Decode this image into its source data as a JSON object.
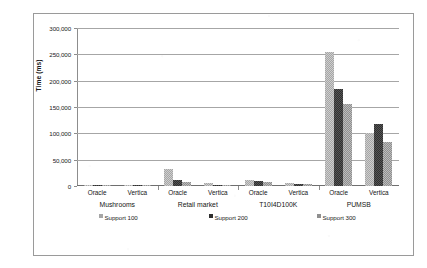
{
  "chart_data": {
    "type": "bar",
    "title": "",
    "xlabel": "",
    "ylabel": "Time (ms)",
    "ylim": [
      0,
      300000
    ],
    "ytick_labels": [
      "300,000",
      "250,000",
      "200,000",
      "150,000",
      "100,000",
      "50,000",
      "0"
    ],
    "ytick_values": [
      300000,
      250000,
      200000,
      150000,
      100000,
      50000,
      0
    ],
    "grid": true,
    "legend_position": "bottom",
    "legend": [
      "Support 100",
      "Support 200",
      "Support 300"
    ],
    "group_labels": [
      "Mushrooms",
      "Retail market",
      "T10I4D100K",
      "PUMSB"
    ],
    "categories": [
      "Mushrooms / Oracle",
      "Mushrooms / Vertica",
      "Retail market / Oracle",
      "Retail market / Vertica",
      "T10I4D100K / Oracle",
      "T10I4D100K / Vertica",
      "PUMSB / Oracle",
      "PUMSB / Vertica"
    ],
    "sub_labels": [
      "Oracle",
      "Vertica",
      "Oracle",
      "Vertica",
      "Oracle",
      "Vertica",
      "Oracle",
      "Vertica"
    ],
    "series": [
      {
        "name": "Support 100",
        "color": "#a6a6a6",
        "values": [
          2500,
          1800,
          33000,
          6000,
          10500,
          6500,
          255000,
          100000
        ]
      },
      {
        "name": "Support 200",
        "color": "#2f2f2f",
        "values": [
          1500,
          1200,
          12000,
          2500,
          9000,
          4500,
          185000,
          117000
        ]
      },
      {
        "name": "Support 300",
        "color": "#8f8f8f",
        "values": [
          1200,
          900,
          7000,
          1500,
          8000,
          3000,
          155000,
          84000
        ]
      }
    ]
  },
  "axis": {
    "y_title": "Time (ms)"
  },
  "groups": [
    {
      "label": "Mushrooms",
      "clusters": [
        {
          "label": "Oracle",
          "values": [
            2500,
            1500,
            1200
          ]
        },
        {
          "label": "Vertica",
          "values": [
            1800,
            1200,
            900
          ]
        }
      ]
    },
    {
      "label": "Retail market",
      "clusters": [
        {
          "label": "Oracle",
          "values": [
            33000,
            12000,
            7000
          ]
        },
        {
          "label": "Vertica",
          "values": [
            6000,
            2500,
            1500
          ]
        }
      ]
    },
    {
      "label": "T10I4D100K",
      "clusters": [
        {
          "label": "Oracle",
          "values": [
            10500,
            9000,
            8000
          ]
        },
        {
          "label": "Vertica",
          "values": [
            6500,
            4500,
            3000
          ]
        }
      ]
    },
    {
      "label": "PUMSB",
      "clusters": [
        {
          "label": "Oracle",
          "values": [
            255000,
            185000,
            155000
          ]
        },
        {
          "label": "Vertica",
          "values": [
            100000,
            117000,
            84000
          ]
        }
      ]
    }
  ],
  "legend": {
    "items": [
      {
        "label": "Support 100",
        "color": "#a6a6a6"
      },
      {
        "label": "Support 200",
        "color": "#2f2f2f"
      },
      {
        "label": "Support 300",
        "color": "#8f8f8f"
      }
    ]
  }
}
